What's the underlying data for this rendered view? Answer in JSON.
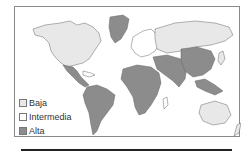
{
  "map": {
    "colors": {
      "baja": "#e8e8e8",
      "intermedia": "#ffffff",
      "alta": "#8c8c8c",
      "border": "#666666"
    }
  },
  "legend": {
    "items": [
      {
        "key": "baja",
        "label": "Baja",
        "color": "#e8e8e8"
      },
      {
        "key": "intermedia",
        "label": "Intermedia",
        "color": "#ffffff"
      },
      {
        "key": "alta",
        "label": "Alta",
        "color": "#8c8c8c"
      }
    ]
  }
}
